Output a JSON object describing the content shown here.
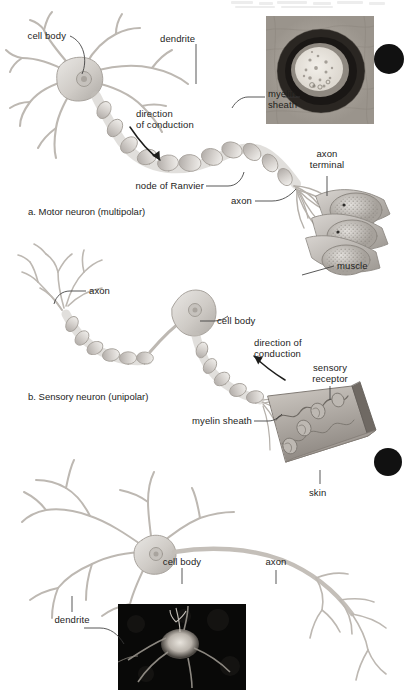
{
  "figure": {
    "background": "#ffffff",
    "ink": "#1d1d1b",
    "leader_color": "#3a3a3a",
    "edge_marker_color": "#111111"
  },
  "panels": [
    {
      "id": "a",
      "caption": "a. Motor neuron (multipolar)",
      "labels": [
        {
          "name": "cell-body",
          "text": "cell body"
        },
        {
          "name": "dendrite",
          "text": "dendrite"
        },
        {
          "name": "myelin-sheath",
          "text": "myelin\nsheath"
        },
        {
          "name": "direction",
          "text": "direction\nof conduction"
        },
        {
          "name": "node-of-ranvier",
          "text": "node of Ranvier"
        },
        {
          "name": "axon",
          "text": "axon"
        },
        {
          "name": "axon-terminal",
          "text": "axon\nterminal"
        },
        {
          "name": "muscle",
          "text": "muscle"
        }
      ],
      "inset": {
        "name": "myelin-micrograph",
        "kind": "electron micrograph of myelinated axon cross-section"
      }
    },
    {
      "id": "b",
      "caption": "b. Sensory neuron (unipolar)",
      "labels": [
        {
          "name": "axon",
          "text": "axon"
        },
        {
          "name": "cell-body",
          "text": "cell body"
        },
        {
          "name": "direction",
          "text": "direction of\nconduction"
        },
        {
          "name": "sensory-receptor",
          "text": "sensory\nreceptor"
        },
        {
          "name": "myelin-sheath",
          "text": "myelin sheath"
        },
        {
          "name": "skin",
          "text": "skin"
        }
      ]
    },
    {
      "id": "c",
      "caption": "",
      "labels": [
        {
          "name": "cell-body",
          "text": "cell body"
        },
        {
          "name": "axon",
          "text": "axon"
        },
        {
          "name": "dendrite",
          "text": "dendrite"
        }
      ],
      "inset": {
        "name": "neuron-micrograph",
        "kind": "dark-field micrograph of a neuron cell body"
      }
    }
  ],
  "edge_markers": [
    {
      "name": "edge-marker-top",
      "shape": "circle"
    },
    {
      "name": "edge-marker-bottom",
      "shape": "circle"
    }
  ]
}
